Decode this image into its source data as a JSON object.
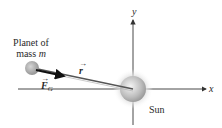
{
  "diagram": {
    "planet_label_line1": "Planet of",
    "planet_label_line2_prefix": "mass ",
    "planet_label_mass_symbol": "m",
    "position_vector_label": "r",
    "force_label": "F",
    "force_subscript": "G",
    "sun_label": "Sun",
    "x_axis_label": "x",
    "y_axis_label": "y"
  },
  "colors": {
    "axis": "#333333",
    "planet": "#a8a8a8",
    "sun": "#c4c4c4",
    "sun_glow": "#dcdcdc",
    "position_line": "#555555",
    "force_arrow": "#111111"
  }
}
